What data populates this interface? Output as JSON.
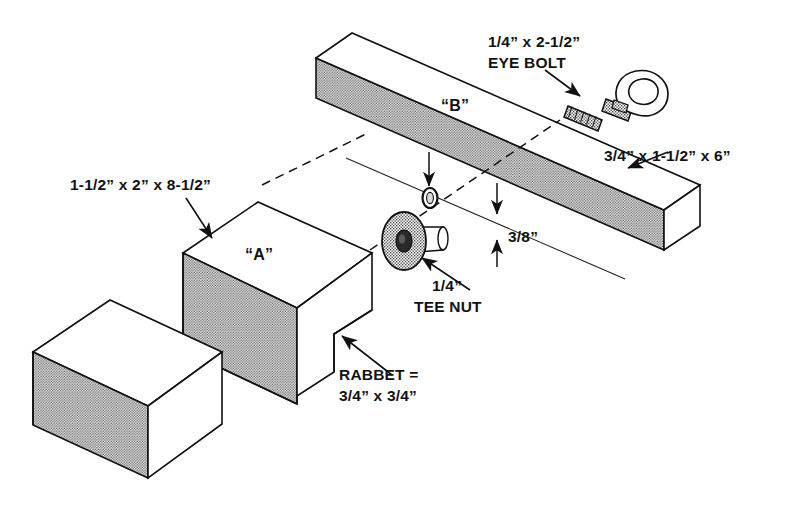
{
  "diagram": {
    "background_color": "#ffffff",
    "line_color": "#111111",
    "stipple_color": "#6b6b6b"
  },
  "labels": {
    "eye_bolt_size": "1/4” x 2-1/2”",
    "eye_bolt_name": "EYE BOLT",
    "board_b_dims": "3/4” x 1-1/2” x 6”",
    "block_a_dims": "1-1/2” x 2” x 8-1/2”",
    "part_b": "“B”",
    "part_a": "“A”",
    "groove_depth": "3/8”",
    "tee_nut_size": "1/4”",
    "tee_nut_name": "TEE NUT",
    "rabbet_line1": "RABBET =",
    "rabbet_line2": "3/4” x 3/4”"
  },
  "parts": {
    "block_left": "plain-block",
    "block_a": "rabbeted-block-a",
    "board_b": "board-b",
    "tee_nut": "tee-nut",
    "eye_bolt": "eye-bolt",
    "hole": "bolt-hole",
    "axis": "assembly-centerline"
  }
}
